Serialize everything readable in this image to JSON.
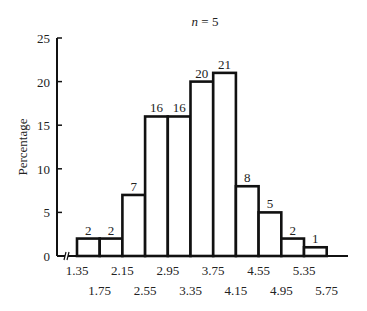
{
  "chart_data": {
    "type": "bar",
    "title": "n = 5",
    "title_var": "n",
    "title_rest": " = 5",
    "xlabel": "",
    "ylabel": "Percentage",
    "ylim": [
      0,
      25
    ],
    "yticks": [
      "0",
      "5",
      "10",
      "15",
      "20",
      "25"
    ],
    "bin_edges": [
      "1.35",
      "1.75",
      "2.15",
      "2.55",
      "2.95",
      "3.35",
      "3.75",
      "4.15",
      "4.55",
      "4.95",
      "5.35",
      "5.75"
    ],
    "xticks_top": [
      "1.35",
      "2.15",
      "2.95",
      "3.75",
      "4.55",
      "5.35"
    ],
    "xticks_bottom": [
      "1.75",
      "2.55",
      "3.35",
      "4.15",
      "4.95",
      "5.75"
    ],
    "categories": [
      "1.35-1.75",
      "1.75-2.15",
      "2.15-2.55",
      "2.55-2.95",
      "2.95-3.35",
      "3.35-3.75",
      "3.75-4.15",
      "4.15-4.55",
      "4.55-4.95",
      "4.95-5.35",
      "5.35-5.75"
    ],
    "values": [
      2,
      2,
      7,
      16,
      16,
      20,
      21,
      8,
      5,
      2,
      1
    ],
    "data_labels": [
      "2",
      "2",
      "7",
      "16",
      "16",
      "20",
      "21",
      "8",
      "5",
      "2",
      "1"
    ],
    "grid": false,
    "legend": null,
    "axis_break": true
  }
}
